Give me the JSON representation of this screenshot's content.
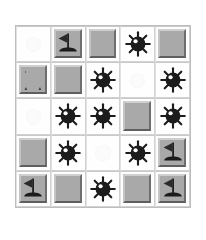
{
  "app": {
    "title": "Minesweeper",
    "board_label": "minesweeper-board"
  },
  "board": {
    "rows": 5,
    "cols": 5,
    "cell_states": {
      "empty": "revealed-empty",
      "covered": "covered-tile",
      "mine": "mine",
      "flag": "flag"
    },
    "colors": {
      "tile_face": "#a9a9a9",
      "tile_highlight": "#cfcfcf",
      "tile_shadow": "#5f5f5f",
      "revealed_bg": "#fefefe",
      "mine_body": "#1c1c1c",
      "flag_cloth": "#2b2b2b",
      "grid_line": "#bdbdbd",
      "page_bg": "#ffffff"
    },
    "grid": [
      [
        {
          "state": "empty",
          "icon": "",
          "label": "row1-col1"
        },
        {
          "state": "flag",
          "icon": "flag-icon",
          "label": "row1-col2"
        },
        {
          "state": "covered",
          "icon": "",
          "label": "row1-col3"
        },
        {
          "state": "mine",
          "icon": "mine-icon",
          "label": "row1-col4"
        },
        {
          "state": "covered",
          "icon": "",
          "label": "row1-col5"
        }
      ],
      [
        {
          "state": "covered",
          "icon": "",
          "label": "row2-col1",
          "smudged": true
        },
        {
          "state": "covered",
          "icon": "",
          "label": "row2-col2"
        },
        {
          "state": "mine",
          "icon": "mine-icon",
          "label": "row2-col3"
        },
        {
          "state": "empty",
          "icon": "",
          "label": "row2-col4"
        },
        {
          "state": "mine",
          "icon": "mine-icon",
          "label": "row2-col5"
        }
      ],
      [
        {
          "state": "empty",
          "icon": "",
          "label": "row3-col1"
        },
        {
          "state": "mine",
          "icon": "mine-icon",
          "label": "row3-col2"
        },
        {
          "state": "mine",
          "icon": "mine-icon",
          "label": "row3-col3"
        },
        {
          "state": "covered",
          "icon": "",
          "label": "row3-col4"
        },
        {
          "state": "mine",
          "icon": "mine-icon",
          "label": "row3-col5"
        }
      ],
      [
        {
          "state": "covered",
          "icon": "",
          "label": "row4-col1"
        },
        {
          "state": "mine",
          "icon": "mine-icon",
          "label": "row4-col2"
        },
        {
          "state": "empty",
          "icon": "",
          "label": "row4-col3"
        },
        {
          "state": "mine",
          "icon": "mine-icon",
          "label": "row4-col4"
        },
        {
          "state": "flag",
          "icon": "flag-icon",
          "label": "row4-col5"
        }
      ],
      [
        {
          "state": "flag",
          "icon": "flag-icon",
          "label": "row5-col1"
        },
        {
          "state": "covered",
          "icon": "",
          "label": "row5-col2"
        },
        {
          "state": "mine",
          "icon": "mine-icon",
          "label": "row5-col3"
        },
        {
          "state": "covered",
          "icon": "",
          "label": "row5-col4"
        },
        {
          "state": "flag",
          "icon": "flag-icon",
          "label": "row5-col5"
        }
      ]
    ]
  }
}
